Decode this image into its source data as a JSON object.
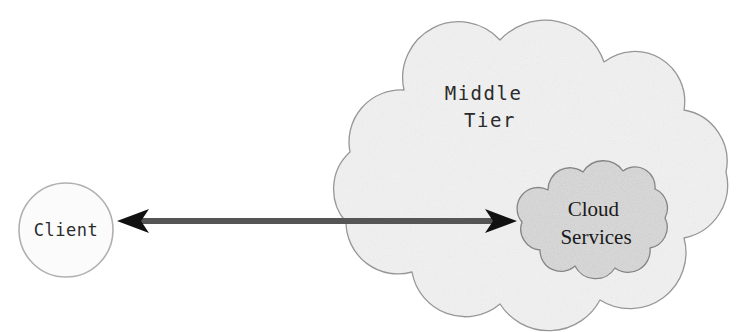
{
  "diagram": {
    "background_color": "#ffffff",
    "nodes": {
      "client": {
        "label": "Client",
        "shape": "circle",
        "fill_color": "#fbfbfb",
        "stroke_color": "#b0b0b0",
        "center_x": 66,
        "center_y": 230,
        "radius": 47
      },
      "middle_tier": {
        "label_line1": "Middle",
        "label_line2": "Tier",
        "label": "Middle Tier",
        "shape": "cloud",
        "fill_color": "#f2f2f2",
        "stroke_color": "#9a9a9a",
        "bounds": {
          "x": 338,
          "y": 18,
          "width": 404,
          "height": 298
        }
      },
      "cloud_services": {
        "label_line1": "Cloud",
        "label_line2": "Services",
        "label": "Cloud Services",
        "shape": "cloud",
        "fill_color": "#dcdcdc",
        "stroke_color": "#8a8a8a",
        "bounds": {
          "x": 515,
          "y": 168,
          "width": 152,
          "height": 104
        }
      }
    },
    "connector": {
      "name": "client-cloud-services-link",
      "style": "double-headed-arrow",
      "color": "#555555",
      "line_thickness": 6,
      "left_tip_x": 117,
      "right_tip_x": 517,
      "y": 221,
      "left_arrowhead": "barbed-left",
      "right_arrowhead": "barbed-right"
    }
  }
}
